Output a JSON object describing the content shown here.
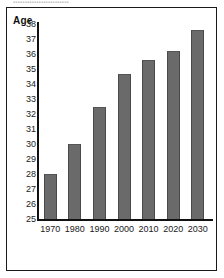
{
  "figure": {
    "top_fragment_text": "▪▪▪▪▪▪▪▪▪▪▪▪▪▪▪▪▪▪▪▪▪▪▪▪",
    "frame_color": "#1a1a1a",
    "background_color": "#ffffff"
  },
  "chart_data": {
    "type": "bar",
    "title": "",
    "subtitle": "",
    "xlabel": "",
    "ylabel": "Age",
    "categories": [
      "1970",
      "1980",
      "1990",
      "2000",
      "2010",
      "2020",
      "2030"
    ],
    "values": [
      28.0,
      30.0,
      32.5,
      34.7,
      35.6,
      36.2,
      37.6
    ],
    "ylim": [
      25,
      38
    ],
    "yticks": [
      25,
      26,
      27,
      28,
      29,
      30,
      31,
      32,
      33,
      34,
      35,
      36,
      37,
      38
    ],
    "ytick_labels": [
      "25",
      "26",
      "27",
      "28",
      "29",
      "30",
      "31",
      "32",
      "33",
      "34",
      "35",
      "36",
      "37",
      "38"
    ],
    "grid": false,
    "legend": false,
    "legend_position": "none",
    "bar_color": "#6a6a6a",
    "bar_edge_color": "#4a4a4a",
    "axis_color": "#111111"
  }
}
